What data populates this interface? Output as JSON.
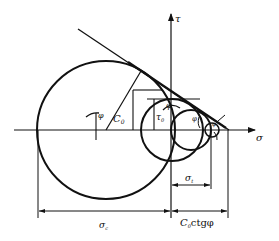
{
  "diagram": {
    "type": "mohr_coulomb_envelope",
    "axes": {
      "x_label": "σ",
      "y_label": "τ"
    },
    "labels": {
      "phi_main": "φ",
      "phi_top": "φ",
      "phi_mid": "φ",
      "phi_small": "φ",
      "c0": "C",
      "c0_sub": "0",
      "tau0": "τ",
      "tau0_sub": "0",
      "sigma_t": "σ",
      "sigma_t_sub": "t",
      "sigma_c": "σ",
      "sigma_c_sub": "c",
      "c0_ctg_phi_c": "C",
      "c0_ctg_phi_sub": "0",
      "c0_ctg_phi_rest": "ctgφ"
    },
    "elements": [
      "uniaxial compression circle (σc)",
      "pure shear circle (τ0)",
      "uniaxial tension circle (σt)",
      "small tension circle",
      "tangent strength envelope line",
      "dimension σc",
      "dimension σt",
      "dimension C0·ctgφ"
    ],
    "colors": {
      "stroke": "#111111",
      "background": "#ffffff"
    }
  }
}
